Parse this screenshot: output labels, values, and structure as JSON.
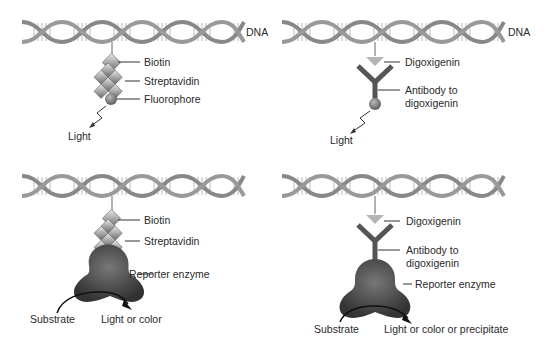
{
  "panels": [
    {
      "id": "top-left",
      "dna_label": "DNA",
      "labels": [
        "Biotin",
        "Streptavidin",
        "Fluorophore"
      ],
      "output": "Light"
    },
    {
      "id": "top-right",
      "dna_label": "DNA",
      "labels": [
        "Digoxigenin",
        "Antibody to",
        "digoxigenin"
      ],
      "output": "Light"
    },
    {
      "id": "bottom-left",
      "labels": [
        "Biotin",
        "Streptavidin",
        "Reporter enzyme"
      ],
      "substrate": "Substrate",
      "output": "Light or color"
    },
    {
      "id": "bottom-right",
      "labels": [
        "Digoxigenin",
        "Antibody to",
        "digoxigenin",
        "Reporter enzyme"
      ],
      "substrate": "Substrate",
      "output": "Light or color or precipitate"
    }
  ],
  "colors": {
    "dna": "#8a8a8a",
    "probe": "#7a7a7a",
    "digoxigenin": "#b5b5b5",
    "enzyme": "#444444"
  }
}
